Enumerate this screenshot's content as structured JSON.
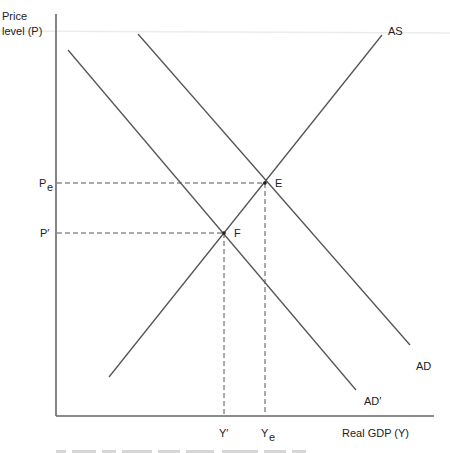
{
  "diagram": {
    "type": "AS-AD macroeconomic equilibrium",
    "axes": {
      "y_label_line1": "Price",
      "y_label_line2": "level (P)",
      "x_label": "Real GDP (Y)"
    },
    "curves": {
      "as": "AS",
      "ad": "AD",
      "ad_prime": "AD′"
    },
    "points": {
      "e": "E",
      "f": "F"
    },
    "price_levels": {
      "pe_main": "P",
      "pe_sub": "e",
      "p_prime": "P′"
    },
    "output_levels": {
      "y_prime": "Y′",
      "ye_main": "Y",
      "ye_sub": "e"
    },
    "colors": {
      "lines": "#555555",
      "axis": "#666666",
      "text": "#222222"
    }
  }
}
